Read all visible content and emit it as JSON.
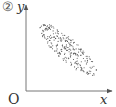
{
  "figure": {
    "label": "②",
    "origin_label": "O",
    "x_axis_label": "x",
    "y_axis_label": "y"
  },
  "chart_data": {
    "type": "scatter",
    "title": "②",
    "xlabel": "x",
    "ylabel": "y",
    "origin_label": "O",
    "grid": false,
    "legend": null,
    "correlation": "negative",
    "point_cloud": {
      "shape": "ellipse",
      "center": [
        0.58,
        0.58
      ],
      "major_axis_direction": "upper-left to lower-right",
      "x_range_normalized": [
        0.17,
        0.82
      ],
      "y_range_normalized": [
        0.14,
        0.8
      ]
    },
    "colors": {
      "points": "#555555",
      "axes": "#555555",
      "background": "#ffffff"
    }
  }
}
